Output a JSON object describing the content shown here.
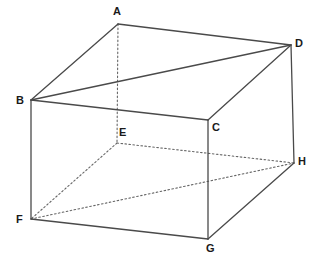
{
  "figure": {
    "type": "3d-solid-line-diagram",
    "background_color": "#ffffff",
    "line_color": "#4a4a4a",
    "hidden_line_color": "#666666",
    "label_color": "#1a1a1a",
    "solid_stroke_width": 1.3,
    "hidden_stroke_width": 1.1,
    "hidden_dash_pattern": "1.6 2.4",
    "canvas": {
      "width": 320,
      "height": 259
    }
  },
  "vertices": [
    {
      "name": "A",
      "x": 118,
      "y": 24,
      "label": "A",
      "label_x": 113,
      "label_y": 6,
      "visible": true
    },
    {
      "name": "B",
      "x": 31,
      "y": 100,
      "label": "B",
      "label_x": 16,
      "label_y": 95,
      "visible": true
    },
    {
      "name": "C",
      "x": 208,
      "y": 120,
      "label": "C",
      "label_x": 212,
      "label_y": 122,
      "visible": true
    },
    {
      "name": "D",
      "x": 291,
      "y": 45,
      "label": "D",
      "label_x": 295,
      "label_y": 38,
      "visible": true
    },
    {
      "name": "E",
      "x": 117,
      "y": 143,
      "label": "E",
      "label_x": 119,
      "label_y": 127,
      "visible": false
    },
    {
      "name": "F",
      "x": 31,
      "y": 219,
      "label": "F",
      "label_x": 16,
      "label_y": 214,
      "visible": true
    },
    {
      "name": "G",
      "x": 208,
      "y": 239,
      "label": "G",
      "label_x": 206,
      "label_y": 243,
      "visible": true
    },
    {
      "name": "H",
      "x": 294,
      "y": 163,
      "label": "H",
      "label_x": 298,
      "label_y": 156,
      "visible": true
    }
  ],
  "edges": [
    {
      "name": "edge-AB",
      "from": "A",
      "to": "B",
      "style": "solid",
      "x1": 118,
      "y1": 24,
      "x2": 31,
      "y2": 100
    },
    {
      "name": "edge-AD",
      "from": "A",
      "to": "D",
      "style": "solid",
      "x1": 118,
      "y1": 24,
      "x2": 291,
      "y2": 45
    },
    {
      "name": "edge-BC",
      "from": "B",
      "to": "C",
      "style": "solid",
      "x1": 31,
      "y1": 100,
      "x2": 208,
      "y2": 120
    },
    {
      "name": "edge-CD",
      "from": "C",
      "to": "D",
      "style": "solid",
      "x1": 208,
      "y1": 120,
      "x2": 291,
      "y2": 45
    },
    {
      "name": "diagonal-BD",
      "from": "B",
      "to": "D",
      "style": "solid",
      "x1": 31,
      "y1": 100,
      "x2": 291,
      "y2": 45
    },
    {
      "name": "edge-BF",
      "from": "B",
      "to": "F",
      "style": "solid",
      "x1": 31,
      "y1": 100,
      "x2": 31,
      "y2": 219
    },
    {
      "name": "edge-CG",
      "from": "C",
      "to": "G",
      "style": "solid",
      "x1": 208,
      "y1": 120,
      "x2": 208,
      "y2": 239
    },
    {
      "name": "edge-DH",
      "from": "D",
      "to": "H",
      "style": "solid",
      "x1": 291,
      "y1": 45,
      "x2": 294,
      "y2": 163
    },
    {
      "name": "edge-FG",
      "from": "F",
      "to": "G",
      "style": "solid",
      "x1": 31,
      "y1": 219,
      "x2": 208,
      "y2": 239
    },
    {
      "name": "edge-GH",
      "from": "G",
      "to": "H",
      "style": "solid",
      "x1": 208,
      "y1": 239,
      "x2": 294,
      "y2": 163
    },
    {
      "name": "edge-AE",
      "from": "A",
      "to": "E",
      "style": "dotted",
      "x1": 118,
      "y1": 24,
      "x2": 117,
      "y2": 143
    },
    {
      "name": "edge-EF",
      "from": "E",
      "to": "F",
      "style": "dotted",
      "x1": 117,
      "y1": 143,
      "x2": 31,
      "y2": 219
    },
    {
      "name": "edge-EH",
      "from": "E",
      "to": "H",
      "style": "dotted",
      "x1": 117,
      "y1": 143,
      "x2": 294,
      "y2": 163
    },
    {
      "name": "diagonal-FH",
      "from": "F",
      "to": "H",
      "style": "dotted",
      "x1": 31,
      "y1": 219,
      "x2": 294,
      "y2": 163
    }
  ]
}
